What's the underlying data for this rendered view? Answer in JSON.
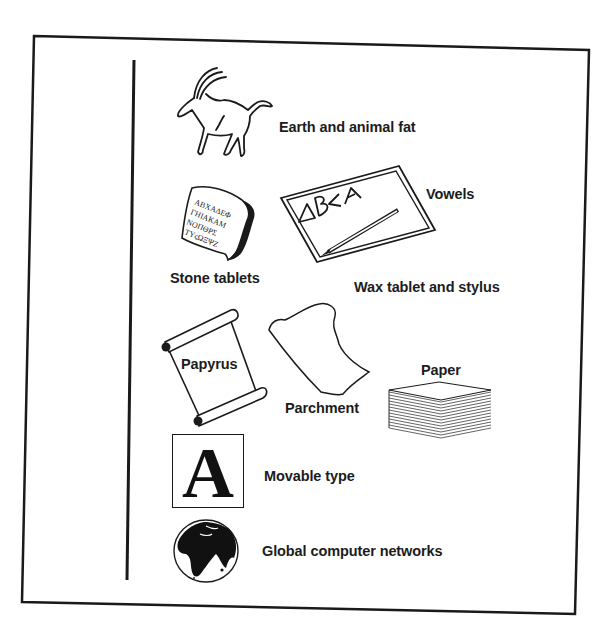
{
  "diagram": {
    "kind": "timeline of writing media",
    "colors": {
      "ink": "#1a1a1a",
      "background": "#ffffff"
    },
    "items": [
      {
        "id": "earth-fat",
        "label": "Earth and animal fat",
        "icon": "ibex-icon"
      },
      {
        "id": "stone",
        "label": "Stone tablets",
        "icon": "stone-tablet-icon",
        "inscription": [
          "ABXAΔEΦ",
          "ΓHIAKAM",
          "NOΠΘPΣ",
          "TYςΩΞΨZ"
        ]
      },
      {
        "id": "vowels",
        "label": "Vowels",
        "icon": "vowels-icon"
      },
      {
        "id": "wax",
        "label": "Wax tablet and stylus",
        "icon": "wax-tablet-icon",
        "tablet_letters": "ΔB<A"
      },
      {
        "id": "papyrus",
        "label": "Papyrus",
        "icon": "papyrus-scroll-icon"
      },
      {
        "id": "parchment",
        "label": "Parchment",
        "icon": "parchment-icon"
      },
      {
        "id": "paper",
        "label": "Paper",
        "icon": "paper-stack-icon"
      },
      {
        "id": "movable-type",
        "label": "Movable type",
        "icon": "letter-a-block-icon",
        "glyph": "A"
      },
      {
        "id": "networks",
        "label": "Global computer networks",
        "icon": "globe-icon"
      }
    ]
  }
}
